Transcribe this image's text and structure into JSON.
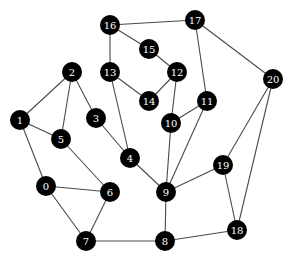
{
  "graph": {
    "node_radius": 10,
    "colors": {
      "node_fill": "#000000",
      "label": "#ffffff",
      "edge": "#4a4a4a",
      "background": "#ffffff"
    },
    "nodes": [
      {
        "id": "0",
        "x": 46,
        "y": 186
      },
      {
        "id": "1",
        "x": 20,
        "y": 120
      },
      {
        "id": "2",
        "x": 72,
        "y": 72
      },
      {
        "id": "3",
        "x": 96,
        "y": 118
      },
      {
        "id": "4",
        "x": 130,
        "y": 158
      },
      {
        "id": "5",
        "x": 61,
        "y": 139
      },
      {
        "id": "6",
        "x": 110,
        "y": 192
      },
      {
        "id": "7",
        "x": 86,
        "y": 241
      },
      {
        "id": "8",
        "x": 165,
        "y": 241
      },
      {
        "id": "9",
        "x": 166,
        "y": 192
      },
      {
        "id": "10",
        "x": 171,
        "y": 123
      },
      {
        "id": "11",
        "x": 207,
        "y": 101
      },
      {
        "id": "12",
        "x": 177,
        "y": 72
      },
      {
        "id": "13",
        "x": 110,
        "y": 72
      },
      {
        "id": "14",
        "x": 149,
        "y": 101
      },
      {
        "id": "15",
        "x": 149,
        "y": 49
      },
      {
        "id": "16",
        "x": 110,
        "y": 25
      },
      {
        "id": "17",
        "x": 195,
        "y": 20
      },
      {
        "id": "18",
        "x": 237,
        "y": 230
      },
      {
        "id": "19",
        "x": 223,
        "y": 165
      },
      {
        "id": "20",
        "x": 273,
        "y": 79
      }
    ],
    "edges": [
      [
        "16",
        "17"
      ],
      [
        "16",
        "15"
      ],
      [
        "16",
        "13"
      ],
      [
        "15",
        "12"
      ],
      [
        "13",
        "14"
      ],
      [
        "13",
        "4"
      ],
      [
        "12",
        "14"
      ],
      [
        "12",
        "10"
      ],
      [
        "17",
        "11"
      ],
      [
        "17",
        "20"
      ],
      [
        "11",
        "10"
      ],
      [
        "11",
        "9"
      ],
      [
        "10",
        "9"
      ],
      [
        "2",
        "1"
      ],
      [
        "2",
        "5"
      ],
      [
        "2",
        "3"
      ],
      [
        "1",
        "5"
      ],
      [
        "1",
        "0"
      ],
      [
        "3",
        "4"
      ],
      [
        "4",
        "9"
      ],
      [
        "5",
        "6"
      ],
      [
        "0",
        "6"
      ],
      [
        "0",
        "7"
      ],
      [
        "6",
        "7"
      ],
      [
        "7",
        "8"
      ],
      [
        "8",
        "9"
      ],
      [
        "8",
        "18"
      ],
      [
        "9",
        "19"
      ],
      [
        "19",
        "20"
      ],
      [
        "19",
        "18"
      ],
      [
        "20",
        "18"
      ]
    ]
  }
}
